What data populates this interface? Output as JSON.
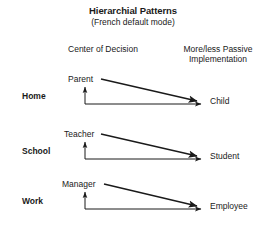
{
  "header": {
    "title": "Hierarchial Patterns",
    "subtitle": "(French default mode)",
    "column_left": "Center of Decision",
    "column_right_line1": "More/less Passive",
    "column_right_line2": "Implementation"
  },
  "rows": [
    {
      "context": "Home",
      "source": "Parent",
      "target": "Child"
    },
    {
      "context": "School",
      "source": "Teacher",
      "target": "Student"
    },
    {
      "context": "Work",
      "source": "Manager",
      "target": "Employee"
    }
  ],
  "style": {
    "line_color": "#1a1a1a",
    "background": "#ffffff"
  }
}
